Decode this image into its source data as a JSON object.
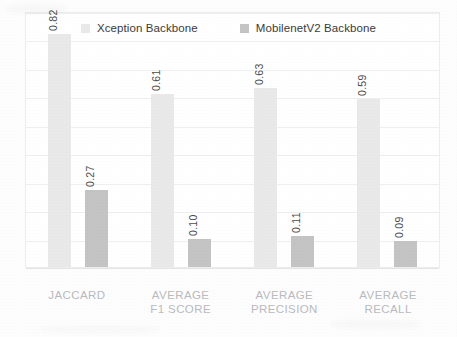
{
  "chart_data": {
    "type": "bar",
    "title": "",
    "subtitle": "",
    "xlabel": "",
    "ylabel": "",
    "categories": [
      "JACCARD",
      "AVERAGE F1 SCORE",
      "AVERAGE PRECISION",
      "AVERAGE RECALL"
    ],
    "category_lines": [
      [
        "JACCARD"
      ],
      [
        "AVERAGE",
        "F1 SCORE"
      ],
      [
        "AVERAGE",
        "PRECISION"
      ],
      [
        "AVERAGE",
        "RECALL"
      ]
    ],
    "series": [
      {
        "name": "Xception Backbone",
        "color": "#e9e9e9",
        "values": [
          0.82,
          0.61,
          0.63,
          0.59
        ],
        "labels": [
          "0.82",
          "0.61",
          "0.63",
          "0.59"
        ]
      },
      {
        "name": "MobilenetV2 Backbone",
        "color": "#c4c4c4",
        "values": [
          0.27,
          0.1,
          0.11,
          0.09
        ],
        "labels": [
          "0.27",
          "0.10",
          "0.11",
          "0.09"
        ]
      }
    ],
    "ylim": [
      0,
      0.9
    ],
    "y_gridline_values": [
      0.1,
      0.2,
      0.3,
      0.4,
      0.5,
      0.6,
      0.7,
      0.8,
      0.9
    ],
    "grid": true,
    "grid_orientation": "horizontal",
    "y_tick_labels_visible": false,
    "legend_position": "top-center",
    "data_labels_rotation_deg": -90,
    "frame": true
  },
  "legend": {
    "entries": [
      {
        "label": "Xception Backbone",
        "color": "#e9e9e9"
      },
      {
        "label": "MobilenetV2 Backbone",
        "color": "#c4c4c4"
      }
    ]
  },
  "colors": {
    "series_1": "#e9e9e9",
    "series_2": "#c4c4c4",
    "gridline": "#eeeff0",
    "frame_border": "#eceded",
    "category_label": "#b9bbbd",
    "value_label": "#4d4d4d",
    "legend_label": "#3b3b3b",
    "background": "#ffffff"
  }
}
